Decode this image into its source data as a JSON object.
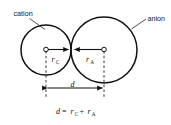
{
  "figure": {
    "type": "diagram",
    "background_color": "#ffffff",
    "line_color": "#111111",
    "width": 171,
    "height": 125,
    "labels": {
      "cation": "cation",
      "anion": "anion",
      "radius_cation_var": "r",
      "radius_cation_sub": "C",
      "radius_anion_var": "r",
      "radius_anion_sub": "A",
      "distance_var": "d"
    },
    "equation": {
      "lhs_var": "d",
      "equals": "=",
      "term1_var": "r",
      "term1_sub": "C",
      "plus": "+",
      "term2_var": "r",
      "term2_sub": "A"
    },
    "geometry": {
      "cation_circle": {
        "cx": 46,
        "cy": 50,
        "r": 25
      },
      "anion_circle": {
        "cx": 104,
        "cy": 50,
        "r": 33
      },
      "contact_x": 71,
      "dimension_line_y": 88,
      "equation_y": 114
    }
  }
}
